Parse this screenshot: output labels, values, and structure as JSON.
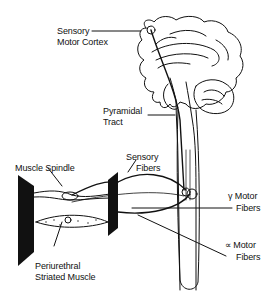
{
  "diagram": {
    "labels": {
      "sensory_motor_cortex_line1": "Sensory",
      "sensory_motor_cortex_line2": "Motor Cortex",
      "pyramidal_tract_line1": "Pyramidal",
      "pyramidal_tract_line2": "Tract",
      "muscle_spindle": "Muscle Spindle",
      "sensory_fibers_line1": "Sensory",
      "sensory_fibers_line2": "Fibers",
      "gamma_motor_fibers_line1": "γ Motor",
      "gamma_motor_fibers_line2": "Fibers",
      "alpha_motor_fibers_line1": "∝ Motor",
      "alpha_motor_fibers_line2": "Fibers",
      "periurethral_line1": "Periurethral",
      "periurethral_line2": "Striated Muscle"
    },
    "colors": {
      "ink": "#111111",
      "background": "#ffffff"
    }
  }
}
